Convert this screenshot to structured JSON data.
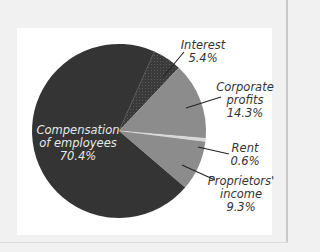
{
  "chart_data": {
    "type": "pie",
    "title": "",
    "categories": [
      "Compensation of employees",
      "Interest",
      "Corporate profits",
      "Rent",
      "Proprietors' income"
    ],
    "values": [
      70.4,
      5.4,
      14.3,
      0.6,
      9.3
    ],
    "units": "%",
    "colors": [
      "#343434",
      "#3f3f3f",
      "#8c8c8c",
      "#d6d6d6",
      "#8c8c8c"
    ],
    "start_angle_deg_clockwise_from_top": 24,
    "order_clockwise": [
      "Interest",
      "Corporate profits",
      "Rent",
      "Proprietors' income",
      "Compensation of employees"
    ]
  },
  "labels": {
    "compensation": {
      "line1": "Compensation",
      "line2": "of employees",
      "value": "70.4%"
    },
    "interest": {
      "line1": "Interest",
      "value": "5.4%"
    },
    "corporate": {
      "line1": "Corporate",
      "line2": "profits",
      "value": "14.3%"
    },
    "rent": {
      "line1": "Rent",
      "value": "0.6%"
    },
    "proprietors": {
      "line1": "Proprietors'",
      "line2": "income",
      "value": "9.3%"
    }
  }
}
